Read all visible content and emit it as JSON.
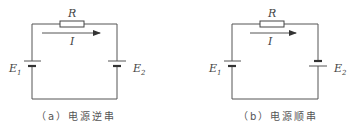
{
  "figure": {
    "panel_a": {
      "resistor_label": "R",
      "current_label": "I",
      "source_left": {
        "main": "E",
        "sub": "1"
      },
      "source_right": {
        "main": "E",
        "sub": "2"
      },
      "caption": "（a）电源逆串"
    },
    "panel_b": {
      "resistor_label": "R",
      "current_label": "I",
      "source_left": {
        "main": "E",
        "sub": "1"
      },
      "source_right": {
        "main": "E",
        "sub": "2"
      },
      "caption": "（b）电源顺串"
    }
  }
}
